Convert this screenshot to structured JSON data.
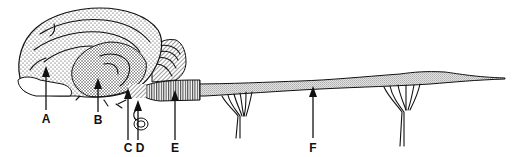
{
  "diagram": {
    "labels": [
      {
        "id": "A",
        "text": "A"
      },
      {
        "id": "B",
        "text": "B"
      },
      {
        "id": "C",
        "text": "C"
      },
      {
        "id": "D",
        "text": "D"
      },
      {
        "id": "E",
        "text": "E"
      },
      {
        "id": "F",
        "text": "F"
      }
    ],
    "colors": {
      "ink": "#111111",
      "background": "#ffffff",
      "cord_fill": "#cfcfcf"
    }
  }
}
